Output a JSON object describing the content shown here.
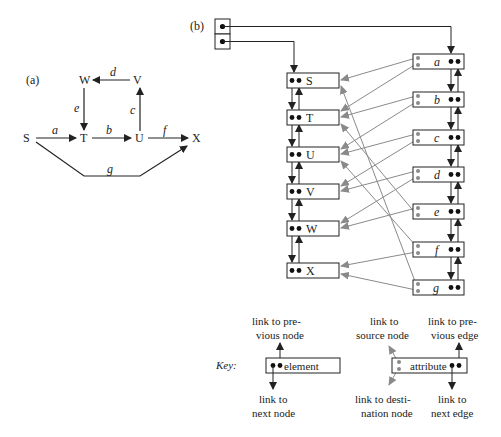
{
  "panel_a": {
    "label": "(a)",
    "nodes": {
      "S": "S",
      "T": "T",
      "U": "U",
      "V": "V",
      "W": "W",
      "X": "X"
    },
    "edges": {
      "a": "a",
      "b": "b",
      "c": "c",
      "d": "d",
      "e": "e",
      "f": "f",
      "g": "g"
    }
  },
  "panel_b": {
    "label": "(b)",
    "node_list": [
      "S",
      "T",
      "U",
      "V",
      "W",
      "X"
    ],
    "edge_list": [
      "a",
      "b",
      "c",
      "d",
      "e",
      "f",
      "g"
    ]
  },
  "key": {
    "title": "Key:",
    "element_box": "element",
    "attribute_box": "attribute",
    "prev_node_1": "link to pre-",
    "prev_node_2": "vious node",
    "next_node_1": "link to",
    "next_node_2": "next node",
    "source_1": "link to",
    "source_2": "source node",
    "dest_1": "link to desti-",
    "dest_2": "nation node",
    "prev_edge_1": "link to pre-",
    "prev_edge_2": "vious edge",
    "next_edge_1": "link to",
    "next_edge_2": "next edge"
  },
  "colors": {
    "ink": "#222222",
    "pointer": "#8a8a8a"
  }
}
